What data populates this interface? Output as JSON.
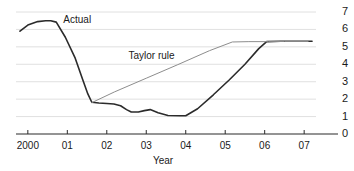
{
  "chart_data": {
    "type": "line",
    "title": "",
    "xlabel": "Year",
    "ylabel": "",
    "ylim": [
      0,
      7
    ],
    "xlim": [
      1999.7,
      2007.3
    ],
    "grid": true,
    "y_axis_position": "right",
    "yticks": [
      7,
      6,
      5,
      4,
      3,
      2,
      1,
      0
    ],
    "ytick_labels": [
      "7",
      "6",
      "5",
      "4",
      "3",
      "2",
      "1",
      "0"
    ],
    "xticks": [
      2000,
      2001,
      2002,
      2003,
      2004,
      2005,
      2006,
      2007
    ],
    "xtick_labels": [
      "2000",
      "01",
      "02",
      "03",
      "04",
      "05",
      "06",
      "07"
    ],
    "legend_position": "inline-annotations",
    "series": [
      {
        "name": "Actual",
        "color": "#2b2b2b",
        "width": 1.6,
        "label_x": 2000.9,
        "label_y": 6.55,
        "x": [
          1999.8,
          2000.0,
          2000.25,
          2000.45,
          2000.58,
          2000.72,
          2000.95,
          2001.2,
          2001.4,
          2001.52,
          2001.62,
          2001.8,
          2002.0,
          2002.18,
          2002.35,
          2002.5,
          2002.62,
          2002.8,
          2002.95,
          2003.1,
          2003.3,
          2003.55,
          2003.85,
          2004.0,
          2004.3,
          2004.7,
          2005.1,
          2005.5,
          2005.85,
          2006.05,
          2006.4,
          2006.9,
          2007.2
        ],
        "y": [
          5.9,
          6.25,
          6.45,
          6.5,
          6.5,
          6.42,
          5.55,
          4.35,
          3.05,
          2.3,
          1.82,
          1.78,
          1.75,
          1.72,
          1.62,
          1.4,
          1.26,
          1.26,
          1.34,
          1.4,
          1.22,
          1.06,
          1.05,
          1.05,
          1.45,
          2.25,
          3.1,
          4.0,
          4.9,
          5.3,
          5.32,
          5.32,
          5.32
        ]
      },
      {
        "name": "Taylor rule",
        "color": "#8d8d8d",
        "width": 1.0,
        "label_x": 2002.55,
        "label_y": 4.48,
        "x": [
          2001.62,
          2002.2,
          2003.0,
          2003.8,
          2004.6,
          2005.18,
          2005.6,
          2006.1,
          2006.5,
          2007.1
        ],
        "y": [
          1.8,
          2.42,
          3.2,
          3.98,
          4.78,
          5.28,
          5.3,
          5.3,
          5.31,
          5.31
        ]
      }
    ]
  }
}
